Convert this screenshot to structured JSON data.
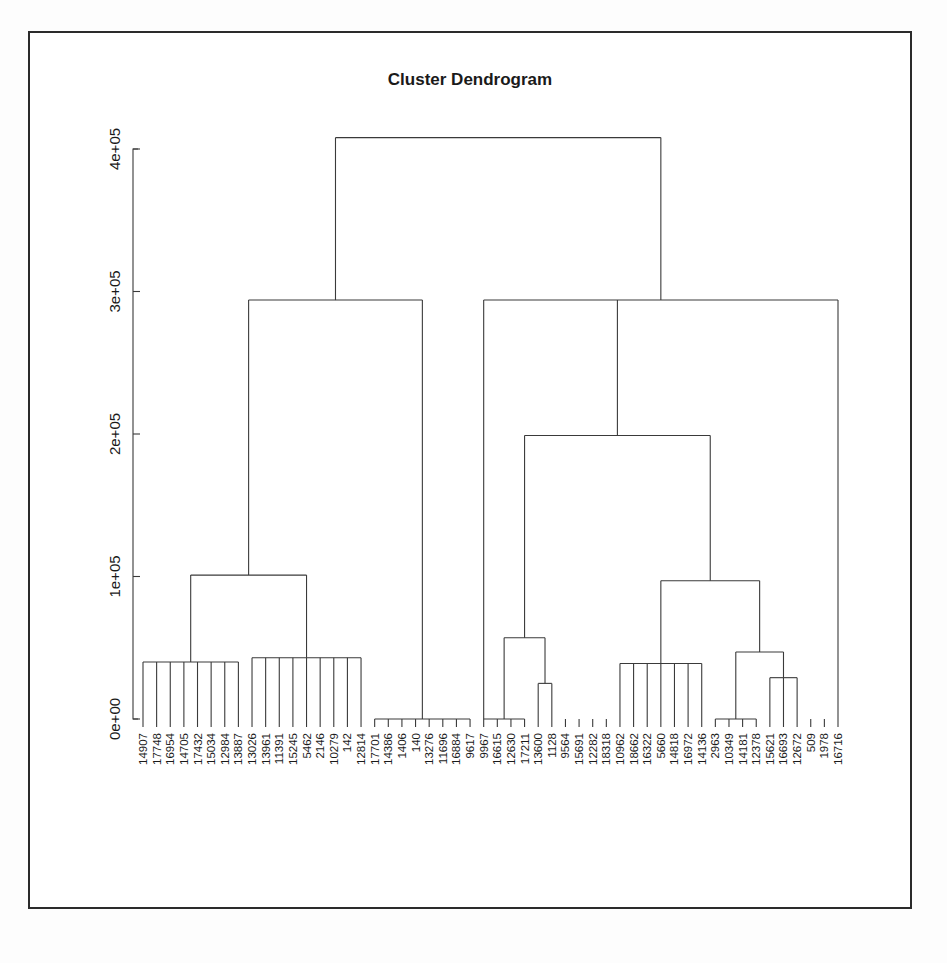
{
  "chart_data": {
    "type": "dendrogram",
    "title": "Cluster Dendrogram",
    "xlabel": "",
    "ylabel": "",
    "ylim": [
      0,
      420000
    ],
    "yticks": [
      0,
      100000,
      200000,
      300000,
      400000
    ],
    "ytick_labels": [
      "0e+00",
      "1e+05",
      "2e+05",
      "3e+05",
      "4e+05"
    ],
    "grid": false,
    "legend": null,
    "leaf_labels": [
      "14907",
      "17748",
      "16954",
      "14705",
      "17432",
      "15034",
      "12984",
      "13887",
      "13026",
      "13961",
      "11391",
      "15245",
      "5462",
      "2146",
      "10279",
      "142",
      "12814",
      "17701",
      "14386",
      "1406",
      "140",
      "13276",
      "11696",
      "16884",
      "9617",
      "9967",
      "16615",
      "12630",
      "17211",
      "13600",
      "1128",
      "9564",
      "15691",
      "12282",
      "18318",
      "10962",
      "18662",
      "16322",
      "5660",
      "14818",
      "16972",
      "14136",
      "2963",
      "10349",
      "14181",
      "12378",
      "15621",
      "16693",
      "12672",
      "509",
      "1978",
      "16716"
    ],
    "merge_heights": [
      {
        "id": "root",
        "height": 408000
      },
      {
        "id": "left-main",
        "height": 294000
      },
      {
        "id": "right-main",
        "height": 294000
      },
      {
        "id": "L-A",
        "height": 101000
      },
      {
        "id": "L-A1",
        "height": 40000
      },
      {
        "id": "L-A2",
        "height": 43000
      },
      {
        "id": "R-A",
        "height": 199000
      },
      {
        "id": "R-B1",
        "height": 57000
      },
      {
        "id": "R-B1a",
        "height": 25000
      },
      {
        "id": "R-C",
        "height": 97000
      },
      {
        "id": "R-C1",
        "height": 39000
      },
      {
        "id": "R-C2",
        "height": 47000
      },
      {
        "id": "R-C2a",
        "height": 29000
      }
    ],
    "axis_max_label": "4e+05"
  },
  "title": {
    "text": "Cluster Dendrogram"
  }
}
